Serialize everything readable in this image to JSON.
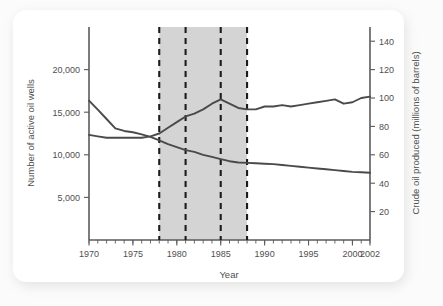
{
  "chart_data": {
    "type": "line",
    "title": "",
    "xlabel": "Year",
    "ylabel": "Number of active oil wells",
    "y2label": "Crude oil produced (millions of barrels)",
    "xlim": [
      1970,
      2002
    ],
    "ylim": [
      0,
      25000
    ],
    "y2lim": [
      0,
      150
    ],
    "grid": false,
    "legend": "none",
    "x_ticks": [
      1970,
      1975,
      1980,
      1985,
      1990,
      1995,
      2000,
      2002
    ],
    "x_tick_labels": [
      "1970",
      "1975",
      "1980",
      "1985",
      "1990",
      "1995",
      "2000",
      "2002"
    ],
    "x_minor_tick_step": 1,
    "y_ticks": [
      5000,
      10000,
      15000,
      20000
    ],
    "y_tick_labels": [
      "5,000",
      "10,000",
      "15,000",
      "20,000"
    ],
    "y2_ticks": [
      20,
      40,
      60,
      80,
      100,
      120,
      140
    ],
    "y2_tick_labels": [
      "20",
      "40",
      "60",
      "80",
      "100",
      "120",
      "140"
    ],
    "shaded_region": {
      "x_start": 1978,
      "x_end": 1988,
      "color": "#d4d4d4"
    },
    "dashed_vlines": [
      1978,
      1981,
      1985,
      1988
    ],
    "series": [
      {
        "name": "Number of active oil wells",
        "axis": "left",
        "color": "#4a4a4a",
        "x": [
          1970,
          1971,
          1972,
          1973,
          1974,
          1975,
          1976,
          1977,
          1978,
          1979,
          1980,
          1981,
          1982,
          1983,
          1984,
          1985,
          1986,
          1987,
          1988,
          1989,
          1990,
          1991,
          1992,
          1993,
          1994,
          1995,
          1996,
          1997,
          1998,
          1999,
          2000,
          2001,
          2002
        ],
        "values": [
          16350,
          15300,
          14200,
          13100,
          12800,
          12650,
          12400,
          12100,
          11700,
          11250,
          10900,
          10550,
          10350,
          10000,
          9750,
          9500,
          9250,
          9100,
          9050,
          9000,
          8950,
          8900,
          8800,
          8700,
          8600,
          8500,
          8400,
          8300,
          8200,
          8100,
          8000,
          7950,
          7900
        ]
      },
      {
        "name": "Crude oil produced (millions of barrels)",
        "axis": "right",
        "color": "#4a4a4a",
        "x": [
          1970,
          1971,
          1972,
          1973,
          1974,
          1975,
          1976,
          1977,
          1978,
          1979,
          1980,
          1981,
          1982,
          1983,
          1984,
          1985,
          1986,
          1987,
          1988,
          1989,
          1990,
          1991,
          1992,
          1993,
          1994,
          1995,
          1996,
          1997,
          1998,
          1999,
          2000,
          2001,
          2002
        ],
        "values": [
          74,
          73,
          72,
          72,
          72,
          72,
          72,
          73,
          75,
          79,
          83,
          87,
          89,
          92,
          96,
          99,
          96,
          93,
          92,
          92,
          94,
          94,
          95,
          94,
          95,
          96,
          97,
          98,
          99,
          96,
          97,
          100,
          101
        ]
      }
    ],
    "annotations": []
  }
}
